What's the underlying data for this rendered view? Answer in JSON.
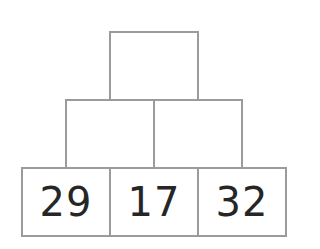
{
  "pyramid": {
    "rows": [
      {
        "cells": [
          {
            "value": ""
          }
        ]
      },
      {
        "cells": [
          {
            "value": ""
          },
          {
            "value": ""
          }
        ]
      },
      {
        "cells": [
          {
            "value": "29"
          },
          {
            "value": "17"
          },
          {
            "value": "32"
          }
        ]
      }
    ]
  },
  "colors": {
    "border": "#9b9b9b",
    "text": "#262626",
    "background": "#ffffff"
  }
}
